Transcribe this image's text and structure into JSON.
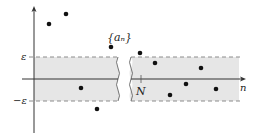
{
  "labels": {
    "sequence": "{aₙ}",
    "epsilon": "ε",
    "neg_epsilon": "−ε",
    "index_N": "N",
    "x_axis": "n"
  },
  "colors": {
    "band_fill": "#e6e6e6",
    "dash_line": "#8c8c8c",
    "axis": "#333333",
    "point": "#111111"
  },
  "points": [
    {
      "x": 49,
      "y": 24
    },
    {
      "x": 66,
      "y": 14
    },
    {
      "x": 81,
      "y": 88
    },
    {
      "x": 97,
      "y": 109
    },
    {
      "x": 111,
      "y": 47
    },
    {
      "x": 140,
      "y": 53
    },
    {
      "x": 155,
      "y": 63
    },
    {
      "x": 170,
      "y": 95
    },
    {
      "x": 186,
      "y": 84
    },
    {
      "x": 201,
      "y": 68
    },
    {
      "x": 216,
      "y": 89
    }
  ]
}
